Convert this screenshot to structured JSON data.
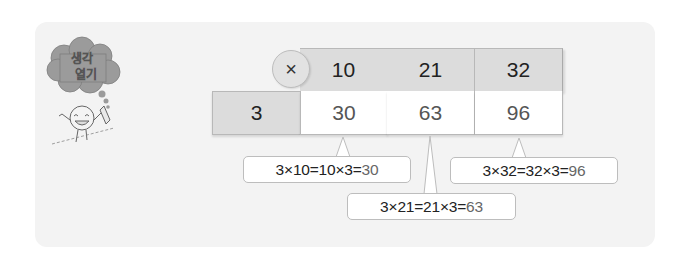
{
  "header": {
    "badge_line1": "생각",
    "badge_line2": "열기",
    "badge_icon": "thought-cloud-mascot-icon"
  },
  "table": {
    "operator": "×",
    "multiplier": "3",
    "columns": [
      "10",
      "21",
      "32"
    ],
    "products": [
      "30",
      "63",
      "96"
    ]
  },
  "callouts": [
    {
      "expression": "3×10=10×3=",
      "result": "30"
    },
    {
      "expression": "3×21=21×3=",
      "result": "63"
    },
    {
      "expression": "3×32=32×3=",
      "result": "96"
    }
  ],
  "colors": {
    "panel_bg": "#f3f3f3",
    "header_cell_bg": "#dcdcdc",
    "value_cell_bg": "#ffffff",
    "border": "#b8b8b8",
    "cloud": "#9a9a9a"
  }
}
